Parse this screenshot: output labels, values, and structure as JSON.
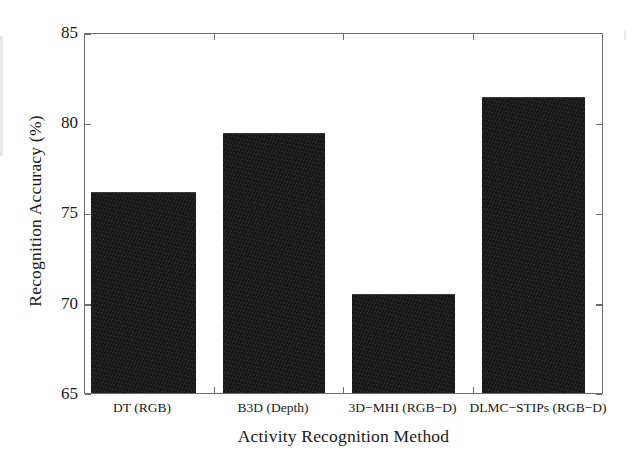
{
  "figure": {
    "background_color": "#ffffff",
    "frame_color": "#6d6d6d",
    "bar_color": "#161616"
  },
  "chart_data": {
    "type": "bar",
    "title": "",
    "xlabel": "Activity Recognition Method",
    "ylabel": "Recognition Accuracy (%)",
    "categories": [
      "DT (RGB)",
      "B3D (Depth)",
      "3D−MHI (RGB−D)",
      "DLMC−STIPs (RGB−D)"
    ],
    "values": [
      76.2,
      79.5,
      70.5,
      81.5
    ],
    "ylim": [
      65,
      85
    ],
    "yticks": [
      65,
      70,
      75,
      80,
      85
    ],
    "ytick_labels": [
      "65",
      "70",
      "75",
      "80",
      "85"
    ],
    "grid": false,
    "legend": null,
    "series": [
      {
        "name": "Recognition Accuracy",
        "values": [
          76.2,
          79.5,
          70.5,
          81.5
        ]
      }
    ]
  }
}
